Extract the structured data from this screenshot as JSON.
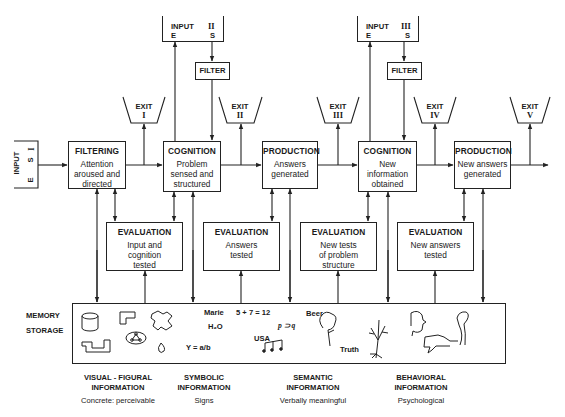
{
  "inputs": [
    {
      "id": "I",
      "label": "INPUT",
      "numeral": "I",
      "left": "E",
      "right": "S"
    },
    {
      "id": "II",
      "label": "INPUT",
      "numeral": "II",
      "left": "E",
      "right": "S"
    },
    {
      "id": "III",
      "label": "INPUT",
      "numeral": "III",
      "left": "E",
      "right": "S"
    }
  ],
  "filters": [
    {
      "label": "FILTER"
    },
    {
      "label": "FILTER"
    }
  ],
  "exits": [
    {
      "label": "EXIT",
      "numeral": "I"
    },
    {
      "label": "EXIT",
      "numeral": "II"
    },
    {
      "label": "EXIT",
      "numeral": "III"
    },
    {
      "label": "EXIT",
      "numeral": "IV"
    },
    {
      "label": "EXIT",
      "numeral": "V"
    }
  ],
  "stages": [
    {
      "title": "FILTERING",
      "lines": [
        "Attention",
        "aroused and",
        "directed"
      ]
    },
    {
      "title": "COGNITION",
      "lines": [
        "Problem",
        "sensed and",
        "structured"
      ]
    },
    {
      "title": "PRODUCTION",
      "lines": [
        "Answers",
        "generated"
      ]
    },
    {
      "title": "COGNITION",
      "lines": [
        "New",
        "information",
        "obtained"
      ]
    },
    {
      "title": "PRODUCTION",
      "lines": [
        "New answers",
        "generated"
      ]
    }
  ],
  "evaluations": [
    {
      "title": "EVALUATION",
      "lines": [
        "Input and",
        "cognition",
        "tested"
      ]
    },
    {
      "title": "EVALUATION",
      "lines": [
        "Answers",
        "tested"
      ]
    },
    {
      "title": "EVALUATION",
      "lines": [
        "New tests",
        "of problem",
        "structure"
      ]
    },
    {
      "title": "EVALUATION",
      "lines": [
        "New answers",
        "tested"
      ]
    }
  ],
  "memory": {
    "label_line1": "MEMORY",
    "label_line2": "STORAGE",
    "symbolic_items": [
      "Marie",
      "H₂O",
      "Y = a/b",
      "5 + 7 = 12",
      "USA"
    ],
    "semantic_items": [
      "p ⊃ q",
      "Beer",
      "Truth"
    ],
    "icons": [
      "cylinder-icon",
      "l-shape-icon",
      "puzzle-shape-icon",
      "step-shape-icon",
      "network-shape-icon",
      "drop-shape-icon",
      "music-notes-icon",
      "tree-bush-icon",
      "bare-tree-icon",
      "face-profile-icon",
      "thumbs-down-hand-icon",
      "raised-fist-icon"
    ]
  },
  "categories": [
    {
      "line1": "VISUAL - FIGURAL",
      "line2": "INFORMATION",
      "desc": "Concrete:  perceivable"
    },
    {
      "line1": "SYMBOLIC",
      "line2": "INFORMATION",
      "desc": "Signs"
    },
    {
      "line1": "SEMANTIC",
      "line2": "INFORMATION",
      "desc": "Verbally meaningful"
    },
    {
      "line1": "BEHAVIORAL",
      "line2": "INFORMATION",
      "desc": "Psychological"
    }
  ]
}
